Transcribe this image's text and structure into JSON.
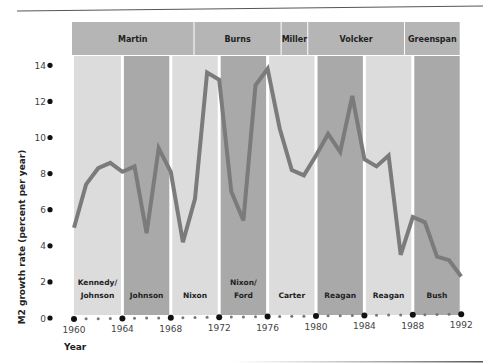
{
  "chart_data": {
    "type": "line",
    "title": "",
    "xlabel": "Year",
    "ylabel": "M2 growth rate (percent per year)",
    "xlim": [
      1960,
      1992
    ],
    "ylim": [
      0,
      14
    ],
    "x_ticks": [
      1960,
      1964,
      1968,
      1972,
      1976,
      1980,
      1984,
      1988,
      1992
    ],
    "y_ticks": [
      0,
      2,
      4,
      6,
      8,
      10,
      12,
      14
    ],
    "grid": false,
    "legend": null,
    "series": [
      {
        "name": "M2 growth rate",
        "x": [
          1960,
          1961,
          1962,
          1963,
          1964,
          1965,
          1966,
          1967,
          1968,
          1969,
          1970,
          1971,
          1972,
          1973,
          1974,
          1975,
          1976,
          1977,
          1978,
          1979,
          1980,
          1981,
          1982,
          1983,
          1984,
          1985,
          1986,
          1987,
          1988,
          1989,
          1990,
          1991,
          1992
        ],
        "values": [
          5.0,
          7.4,
          8.3,
          8.6,
          8.1,
          8.4,
          4.7,
          9.4,
          8.1,
          4.2,
          6.6,
          13.6,
          13.2,
          7.0,
          5.4,
          12.9,
          13.8,
          10.5,
          8.2,
          7.9,
          9.0,
          10.2,
          9.2,
          12.3,
          8.8,
          8.4,
          9.0,
          3.5,
          5.6,
          5.3,
          3.4,
          3.2,
          2.3
        ]
      }
    ],
    "fed_chairs": [
      {
        "name": "Martin",
        "from": 1960,
        "to": 1970
      },
      {
        "name": "Burns",
        "from": 1970,
        "to": 1977.2
      },
      {
        "name": "Miller",
        "from": 1977.2,
        "to": 1979.4
      },
      {
        "name": "Volcker",
        "from": 1979.4,
        "to": 1987.4
      },
      {
        "name": "Greenspan",
        "from": 1987.4,
        "to": 1992
      }
    ],
    "presidencies": [
      {
        "label": [
          "Kennedy/",
          "Johnson"
        ],
        "from": 1960,
        "to": 1964,
        "shade": "light"
      },
      {
        "label": [
          "Johnson"
        ],
        "from": 1964,
        "to": 1968,
        "shade": "dark"
      },
      {
        "label": [
          "Nixon"
        ],
        "from": 1968,
        "to": 1972,
        "shade": "light"
      },
      {
        "label": [
          "Nixon/",
          "Ford"
        ],
        "from": 1972,
        "to": 1976,
        "shade": "dark"
      },
      {
        "label": [
          "Carter"
        ],
        "from": 1976,
        "to": 1980,
        "shade": "light"
      },
      {
        "label": [
          "Reagan"
        ],
        "from": 1980,
        "to": 1984,
        "shade": "dark"
      },
      {
        "label": [
          "Reagan"
        ],
        "from": 1984,
        "to": 1988,
        "shade": "light"
      },
      {
        "label": [
          "Bush"
        ],
        "from": 1988,
        "to": 1992,
        "shade": "dark"
      }
    ]
  },
  "colors": {
    "band_light": "#dcdcdc",
    "band_dark": "#a9a9a9",
    "header": "#b5b5b5",
    "line": "#7b7b7b",
    "text": "#222222",
    "tick_text": "#444444",
    "rule": "#555555"
  }
}
